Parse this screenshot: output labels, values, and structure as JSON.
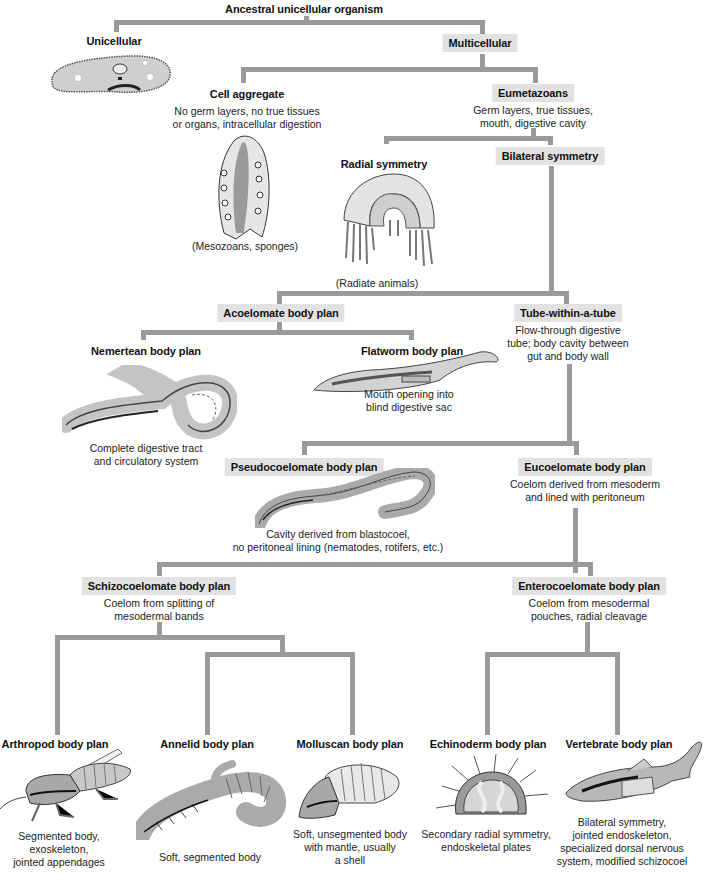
{
  "diagram": {
    "root": {
      "title": "Ancestral unicellular organism"
    },
    "nodes": {
      "unicellular": {
        "title": "Unicellular",
        "illustration": "paramecium-icon"
      },
      "multicellular": {
        "title": "Multicellular"
      },
      "cell_aggregate": {
        "title": "Cell aggregate",
        "desc": [
          "No germ layers, no true tissues",
          "or organs, intracellular digestion"
        ],
        "caption": "(Mesozoans, sponges)",
        "illustration": "sponge-icon"
      },
      "eumetazoans": {
        "title": "Eumetazoans",
        "desc": [
          "Germ layers, true tissues,",
          "mouth, digestive cavity"
        ]
      },
      "radial_symmetry": {
        "title": "Radial symmetry",
        "caption": "(Radiate animals)",
        "illustration": "jellyfish-icon"
      },
      "bilateral_symmetry": {
        "title": "Bilateral symmetry"
      },
      "acoelomate": {
        "title": "Acoelomate body plan"
      },
      "tube_within_tube": {
        "title": "Tube-within-a-tube",
        "desc": [
          "Flow-through digestive",
          "tube; body cavity between",
          "gut and body wall"
        ]
      },
      "nemertean": {
        "title": "Nemertean body plan",
        "desc": [
          "Complete digestive tract",
          "and circulatory system"
        ],
        "illustration": "ribbon-worm-icon"
      },
      "flatworm": {
        "title": "Flatworm body plan",
        "desc": [
          "Mouth opening into",
          "blind digestive sac"
        ],
        "illustration": "flatworm-icon"
      },
      "pseudocoelomate": {
        "title": "Pseudocoelomate body plan",
        "desc": [
          "Cavity derived from blastocoel,",
          "no peritoneal lining (nematodes, rotifers, etc.)"
        ],
        "illustration": "roundworm-icon"
      },
      "eucoelomate": {
        "title": "Eucoelomate body plan",
        "desc": [
          "Coelom derived from mesoderm",
          "and lined with peritoneum"
        ]
      },
      "schizocoelomate": {
        "title": "Schizocoelomate body plan",
        "desc": [
          "Coelom from splitting of",
          "mesodermal bands"
        ]
      },
      "enterocoelomate": {
        "title": "Enterocoelomate body plan",
        "desc": [
          "Coelom from mesodermal",
          "pouches, radial cleavage"
        ]
      },
      "arthropod": {
        "title": "Arthropod body plan",
        "desc": [
          "Segmented body,",
          "exoskeleton,",
          "jointed appendages"
        ],
        "illustration": "insect-icon"
      },
      "annelid": {
        "title": "Annelid body plan",
        "desc": [
          "Soft, segmented body"
        ],
        "illustration": "earthworm-icon"
      },
      "molluscan": {
        "title": "Molluscan body plan",
        "desc": [
          "Soft, unsegmented body",
          "with mantle, usually",
          "a shell"
        ],
        "illustration": "chiton-icon"
      },
      "echinoderm": {
        "title": "Echinoderm body plan",
        "desc": [
          "Secondary radial symmetry,",
          "endoskeletal plates"
        ],
        "illustration": "sea-urchin-icon"
      },
      "vertebrate": {
        "title": "Vertebrate body plan",
        "desc": [
          "Bilateral symmetry,",
          "jointed endoskeleton,",
          "specialized dorsal nervous",
          "system, modified schizocoel"
        ],
        "illustration": "fish-icon"
      }
    },
    "colors": {
      "connector": "#9a9a9a",
      "label_box": "#e2e2e2",
      "text": "#111111"
    }
  }
}
